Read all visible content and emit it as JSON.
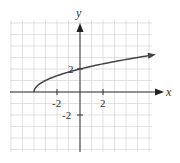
{
  "chart_data": {
    "type": "line",
    "title": "",
    "function": "y = sqrt(x + 4)",
    "xlabel": "x",
    "ylabel": "y",
    "xlim": [
      -6,
      6.5
    ],
    "ylim": [
      -5,
      6
    ],
    "grid": true,
    "x_ticks": [
      {
        "value": -2,
        "label": "-2"
      },
      {
        "value": 2,
        "label": "2"
      }
    ],
    "y_ticks": [
      {
        "value": 2,
        "label": "2"
      },
      {
        "value": -2,
        "label": "-2"
      }
    ],
    "series": [
      {
        "name": "f(x)",
        "start_point": [
          -4,
          0
        ],
        "end_arrow": true,
        "x": [
          -4,
          -3.5,
          -3,
          -2,
          -1,
          0,
          1,
          2,
          3,
          4,
          5,
          6,
          6.3
        ],
        "y": [
          0,
          0.71,
          1,
          1.41,
          1.73,
          2,
          2.24,
          2.45,
          2.65,
          2.83,
          3,
          3.16,
          3.21
        ]
      }
    ],
    "legend": null
  },
  "labels": {
    "x_axis": "x",
    "y_axis": "y",
    "tick_x_neg2": "-2",
    "tick_x_2": "2",
    "tick_y_2": "2",
    "tick_y_neg2": "-2"
  }
}
